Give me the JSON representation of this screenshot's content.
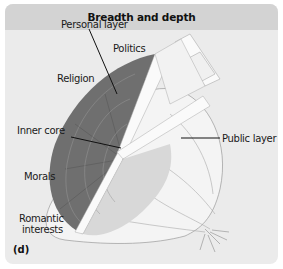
{
  "title": "Breadth and depth",
  "panel_letter": "(d)",
  "labels": {
    "personal_layer": "Personal layer",
    "politics": "Politics",
    "religion": "Religion",
    "inner_core": "Inner core",
    "morals": "Morals",
    "romantic_line1": "Romantic",
    "romantic_line2": "interests",
    "public_layer": "Public layer"
  },
  "colors": {
    "header_bg": "#d3d3d3",
    "panel_bg": "#ebebeb",
    "personal_layer_fill": "#6f6f6f",
    "onion_outline": "#9a9a9a"
  }
}
